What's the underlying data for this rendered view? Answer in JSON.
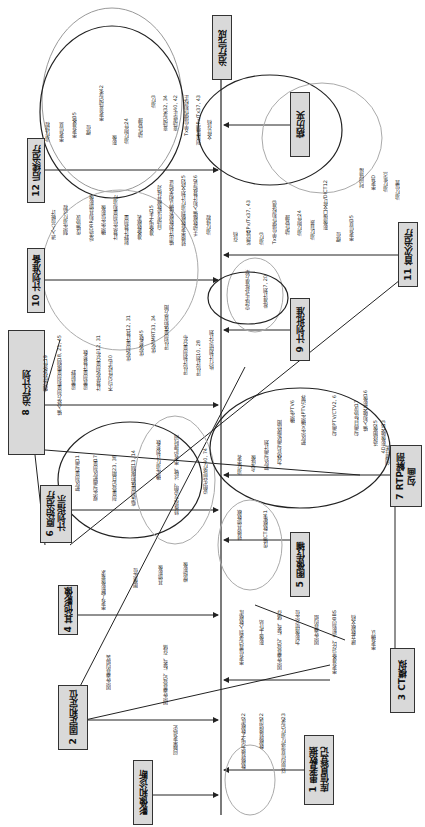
{
  "diagram": {
    "type": "fishbone",
    "orientation": "rotated-90",
    "spine_start": "影像和诊断",
    "spine_end": "治疗完成",
    "nodes": [
      {
        "id": "n0",
        "label": "影像和诊断"
      },
      {
        "id": "n1",
        "label": "1 患者数据\n库信息登记"
      },
      {
        "id": "n2",
        "label": "2 固定和定位"
      },
      {
        "id": "n3",
        "label": "3 CT模拟"
      },
      {
        "id": "n4",
        "label": "4 其他影像"
      },
      {
        "id": "n5",
        "label": "5 图像传输"
      },
      {
        "id": "n6",
        "label": "6 原始治疗\n计划指示"
      },
      {
        "id": "n7",
        "label": "7 RTP解剖\n勾画"
      },
      {
        "id": "n8",
        "label": "8 治疗计划"
      },
      {
        "id": "n9",
        "label": "9 计划批准"
      },
      {
        "id": "n10",
        "label": "10 计划准备"
      },
      {
        "id": "n11",
        "label": "11 首次治疗"
      },
      {
        "id": "n12",
        "label": "12 后续治疗"
      },
      {
        "id": "n13",
        "label": "病历夹"
      },
      {
        "id": "n14",
        "label": "治疗完成"
      }
    ],
    "branches": {
      "imaging_diagnosis": [
        "问题患者病史"
      ],
      "patient_registration": [
        "数据转换为电子数据库22",
        "数据转换错误22",
        "以前的信息或疗治疗记录23"
      ],
      "immobilization": [
        "固定装置的组装",
        "固定装置登记、标签、存储"
      ],
      "ct_sim": [
        "患者位置记录到入数据库",
        "影像工作站",
        "固定装置登记、标签、储存",
        "为影像研究定位",
        "固定装置的组",
        "患者准备(对比、造影剂)BBS",
        "建立数据文档",
        "患者确认"
      ],
      "other_imaging": [
        "患者了解影像要求",
        "图像定位",
        "其他影像",
        "模拟影像"
      ],
      "image_transfer": [
        "转换其他数据",
        "传输CT数据集41"
      ],
      "initial_plan_directive": [
        "靶区剂量勾画11",
        "规定勾画靶区剂量17",
        "剂量登记日期23, 38",
        "临床剂量体积限制13, 14",
        "确定治疗计划参数",
        "特殊指令说明、过敏、患者护理时间",
        "说明先前放疗40, 74"
      ],
      "rtp_contouring": [
        "治疗患者",
        "4D成像",
        "靶区勾画计划",
        "为器官勾画轮廓绘图",
        "确定PTV6",
        "勾画PTV/CTV2, 6",
        "靶区定义确定PTV边界",
        "勾画目标协议17",
        "输入和融合影像16",
        "选择图像25",
        "4D影像融合13",
        "创建任务"
      ],
      "treatment_planning": [
        "制定优化条件19",
        "输入处方剂量和剂量限制18, 21, 45",
        "设置射野",
        "设置剂量计算参数",
        "计算优化剂量分布12, 31",
        "不均匀性校正30",
        "优化剂量计算12, 31",
        "优化参数45",
        "优化IMRT33, 34",
        "评估剂量体积直方图",
        "评估计划剂量分布",
        "评估计划10, 28",
        "执行计划研究计划"
      ],
      "plan_approval": [
        "完成正式批准方案",
        "批准计划7, 20"
      ],
      "plan_preparation": [
        "进入人员统计",
        "制定治疗过程",
        "传输协议",
        "受选DRR和其他影像",
        "确定定位影像",
        "计算定位剂量和治疗",
        "射野计算剂量",
        "准备数据表",
        "准备电子表15",
        "自动传送数据并核对",
        "输出计划数据及确认相关验证",
        "转换患者数据到治疗计划文档25",
        "手动数据输入和计算验证26",
        "治疗排程"
      ],
      "first_treatment": [
        "存档",
        "监控器Pv/Tx37, 43",
        "治疗3",
        "Tx单位操作和校准3",
        "动作管理",
        "治疗附件24",
        "治疗背景",
        "影像接口文件/DICT12",
        "摆位",
        "患者信息35",
        "时间链接",
        "患者ID",
        "治疗焦点",
        "治疗位置"
      ],
      "subsequent_treatment": [
        "治疗排程",
        "患者信息",
        "患者准备35",
        "摆位",
        "患者变动记录42",
        "影像",
        "治疗附件24",
        "动作管理",
        "治疗3",
        "变动记录32, 34",
        "变动修正40, 42",
        "Tx单位操作和校正",
        "剂量监测Pv/Tx37, 43",
        "文件存档"
      ]
    }
  }
}
